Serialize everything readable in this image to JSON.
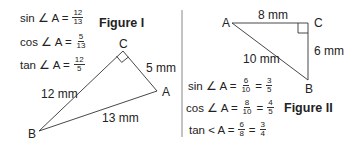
{
  "figure1": {
    "title": "Figure I",
    "equations": [
      {
        "lhs": "sin ∠ A =",
        "fractions": [
          {
            "num": "12",
            "den": "13"
          }
        ]
      },
      {
        "lhs": "cos ∠ A =",
        "fractions": [
          {
            "num": "5",
            "den": "13"
          }
        ]
      },
      {
        "lhs": "tan ∠ A =",
        "fractions": [
          {
            "num": "12",
            "den": "5"
          }
        ]
      }
    ],
    "vertices": {
      "A": "A",
      "B": "B",
      "C": "C"
    },
    "sides": {
      "CA": "5 mm",
      "BC": "12 mm",
      "AB": "13 mm"
    }
  },
  "figure2": {
    "title": "Figure II",
    "equations": [
      {
        "lhs": "sin ∠ A =",
        "fractions": [
          {
            "num": "6",
            "den": "10"
          },
          {
            "num": "3",
            "den": "5"
          }
        ]
      },
      {
        "lhs": "cos ∠ A =",
        "fractions": [
          {
            "num": "8",
            "den": "10"
          },
          {
            "num": "4",
            "den": "5"
          }
        ]
      },
      {
        "lhs": "tan < A =",
        "fractions": [
          {
            "num": "6",
            "den": "8"
          },
          {
            "num": "3",
            "den": "4"
          }
        ]
      }
    ],
    "eq_sign": "=",
    "vertices": {
      "A": "A",
      "B": "B",
      "C": "C"
    },
    "sides": {
      "AC": "8 mm",
      "CB": "6 mm",
      "AB": "10 mm"
    }
  },
  "colors": {
    "line": "#333333",
    "divider": "#888888",
    "text": "#222222"
  }
}
